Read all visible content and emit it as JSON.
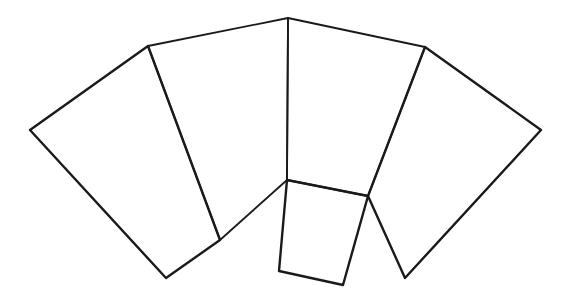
{
  "diagram": {
    "type": "net",
    "stroke_color": "#1a1a1a",
    "background": "#ffffff",
    "vertices": {
      "left_tip": [
        30,
        130
      ],
      "upper_left": [
        148,
        46
      ],
      "top_center": [
        288,
        18
      ],
      "upper_right": [
        425,
        47
      ],
      "right_tip": [
        541,
        130
      ],
      "left_bottom": [
        166,
        278
      ],
      "inner_left": [
        220,
        240
      ],
      "center": [
        287,
        180
      ],
      "square_right_top": [
        368,
        196
      ],
      "square_bottom_right": [
        343,
        285
      ],
      "square_bottom_left": [
        279,
        271
      ],
      "right_bottom": [
        405,
        278
      ]
    },
    "faces": [
      {
        "name": "left-face",
        "points": "30,130 148,46 220,240 166,278"
      },
      {
        "name": "center-left-face",
        "points": "148,46 288,18 287,180 220,240"
      },
      {
        "name": "center-right-face",
        "points": "288,18 425,47 368,196 287,180"
      },
      {
        "name": "right-face",
        "points": "425,47 541,130 405,278 368,196"
      },
      {
        "name": "base-face",
        "points": "287,180 368,196 343,285 279,271"
      }
    ]
  }
}
